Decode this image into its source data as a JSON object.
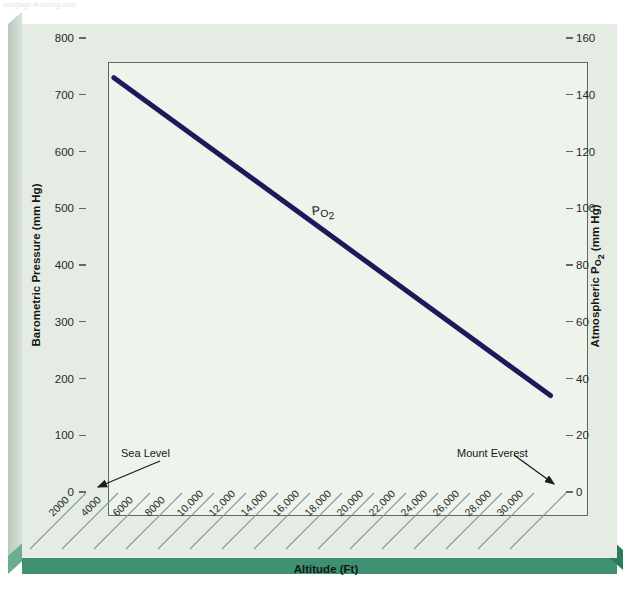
{
  "watermark": "cengage-learning.com",
  "chart_data": {
    "type": "line",
    "title": "",
    "xlabel": "Altitude (Ft)",
    "ylabel": "Barometric Pressure (mm Hg)",
    "y2label": "Atmospheric PO2 (mm Hg)",
    "ylabel_parts": {
      "pre": "Barometric Pressure (mm Hg)"
    },
    "y2label_parts": {
      "pre": "Atmospheric P",
      "sub": "O2",
      "post": " (mm Hg)"
    },
    "xlim": [
      0,
      31000
    ],
    "ylim": [
      0,
      800
    ],
    "y2lim": [
      0,
      160
    ],
    "grid": false,
    "legend": "none",
    "yticks": [
      0,
      100,
      200,
      300,
      400,
      500,
      600,
      700,
      800
    ],
    "yticklabels": [
      "0",
      "100",
      "200",
      "300",
      "400",
      "500",
      "600",
      "700",
      "800"
    ],
    "y2ticks": [
      0,
      20,
      40,
      60,
      80,
      100,
      120,
      140,
      160
    ],
    "y2ticklabels": [
      "0",
      "20",
      "40",
      "60",
      "80",
      "100",
      "120",
      "140",
      "160"
    ],
    "xticks": [
      2000,
      4000,
      6000,
      8000,
      10000,
      12000,
      14000,
      16000,
      18000,
      20000,
      22000,
      24000,
      26000,
      28000,
      30000
    ],
    "xticklabels": [
      "2000",
      "4000",
      "6000",
      "8000",
      "10,000",
      "12,000",
      "14,000",
      "16,000",
      "18,000",
      "20,000",
      "22,000",
      "24,000",
      "26,000",
      "28,000",
      "30,000"
    ],
    "series": [
      {
        "name": "PO2",
        "label_pre": "P",
        "label_sub": "O2",
        "color": "#1b1b5c",
        "x": [
          1800,
          30000
        ],
        "y": [
          730,
          170
        ],
        "y2": [
          146,
          34
        ]
      }
    ],
    "annotations": [
      {
        "text": "Sea Level",
        "points_to": "origin"
      },
      {
        "text": "Mount Everest",
        "points_to": "x-axis-right-end"
      }
    ]
  },
  "colors": {
    "card_bg": "#e4ece3",
    "plot_bg": "#eef4ec",
    "axis": "#5c6a5f",
    "line": "#1b1b5c",
    "bottom_bar": "#3d9070",
    "text": "#141815"
  }
}
